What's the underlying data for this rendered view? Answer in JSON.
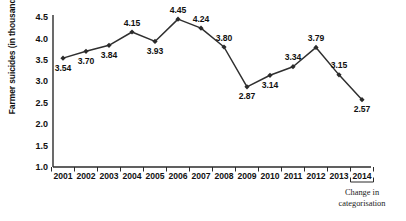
{
  "chart_data": {
    "type": "line",
    "title": "",
    "xlabel": "",
    "ylabel": "Farmer suicides (in thousand)",
    "categories": [
      "2001",
      "2002",
      "2003",
      "2004",
      "2005",
      "2006",
      "2007",
      "2008",
      "2009",
      "2010",
      "2011",
      "2012",
      "2013",
      "2014"
    ],
    "values": [
      3.54,
      3.7,
      3.84,
      4.15,
      3.93,
      4.45,
      4.24,
      3.8,
      2.87,
      3.14,
      3.34,
      3.79,
      3.15,
      2.57
    ],
    "value_labels": [
      "3.54",
      "3.70",
      "3.84",
      "4.15",
      "3.93",
      "4.45",
      "4.24",
      "3.80",
      "2.87",
      "3.14",
      "3.34",
      "3.79",
      "3.15",
      "2.57"
    ],
    "label_positions": [
      "below",
      "below",
      "below",
      "above",
      "below",
      "above",
      "above",
      "above",
      "below",
      "below",
      "above",
      "above",
      "above",
      "below"
    ],
    "ylim": [
      1.0,
      4.5
    ],
    "yticks": [
      "1.0",
      "1.5",
      "2.0",
      "2.5",
      "3.0",
      "3.5",
      "4.0",
      "4.5"
    ],
    "ytick_values": [
      1.0,
      1.5,
      2.0,
      2.5,
      3.0,
      3.5,
      4.0,
      4.5
    ],
    "grid": false,
    "legend": "none",
    "marker": "diamond",
    "line_color": "#2f2f2f",
    "marker_color": "#2b2b2b",
    "axis_color": "#2b2b2b",
    "annotations": [
      {
        "text_line1": "Change in",
        "text_line2": "categorisation",
        "target_category": "2014",
        "style": "bracket-below-axis"
      }
    ]
  }
}
